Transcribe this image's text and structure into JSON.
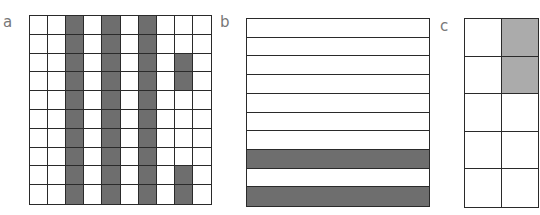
{
  "panels": [
    {
      "label": "a",
      "rows": 10,
      "cols": 10,
      "shade_color": "#6e6e6e",
      "shaded_cells": [
        [
          0,
          2
        ],
        [
          1,
          2
        ],
        [
          2,
          2
        ],
        [
          3,
          2
        ],
        [
          4,
          2
        ],
        [
          5,
          2
        ],
        [
          6,
          2
        ],
        [
          7,
          2
        ],
        [
          8,
          2
        ],
        [
          9,
          2
        ],
        [
          0,
          4
        ],
        [
          1,
          4
        ],
        [
          2,
          4
        ],
        [
          3,
          4
        ],
        [
          4,
          4
        ],
        [
          5,
          4
        ],
        [
          6,
          4
        ],
        [
          7,
          4
        ],
        [
          8,
          4
        ],
        [
          9,
          4
        ],
        [
          0,
          6
        ],
        [
          1,
          6
        ],
        [
          2,
          6
        ],
        [
          3,
          6
        ],
        [
          4,
          6
        ],
        [
          5,
          6
        ],
        [
          6,
          6
        ],
        [
          7,
          6
        ],
        [
          8,
          6
        ],
        [
          9,
          6
        ],
        [
          2,
          8
        ],
        [
          3,
          8
        ],
        [
          8,
          8
        ],
        [
          9,
          8
        ]
      ],
      "box": {
        "x": 29,
        "y": 15,
        "w": 183,
        "h": 190
      },
      "label_pos": {
        "x": 3,
        "y": 15
      }
    },
    {
      "label": "b",
      "rows": 10,
      "cols": 1,
      "shade_color": "#6e6e6e",
      "shaded_cells": [
        [
          7,
          0
        ],
        [
          9,
          0
        ]
      ],
      "box": {
        "x": 246,
        "y": 18,
        "w": 184,
        "h": 189
      },
      "label_pos": {
        "x": 220,
        "y": 15
      }
    },
    {
      "label": "c",
      "rows": 5,
      "cols": 2,
      "shade_color": "#ababab",
      "shaded_cells": [
        [
          0,
          1
        ],
        [
          1,
          1
        ]
      ],
      "box": {
        "x": 464,
        "y": 18,
        "w": 75,
        "h": 190
      },
      "label_pos": {
        "x": 440,
        "y": 19
      }
    }
  ]
}
